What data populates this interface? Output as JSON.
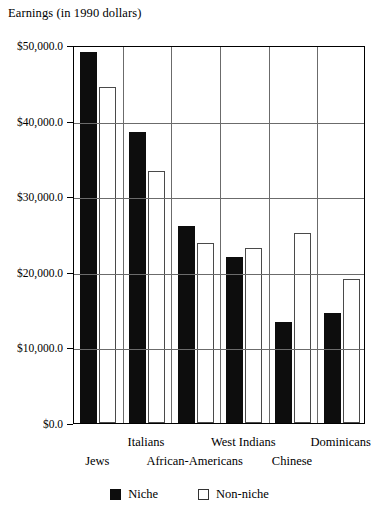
{
  "chart_data": {
    "type": "bar",
    "title": "Earnings (in 1990 dollars)",
    "xlabel": "",
    "ylabel": "",
    "ylim": [
      0,
      50000
    ],
    "grid": true,
    "legend_position": "bottom-center",
    "categories": [
      "Jews",
      "Italians",
      "African-Americans",
      "West Indians",
      "Chinese",
      "Dominicans"
    ],
    "ytick_labels": [
      "$0.0",
      "$10,000.0",
      "$20,000.0",
      "$30,000.0",
      "$40,000.0",
      "$50,000.0"
    ],
    "ytick_values": [
      0,
      10000,
      20000,
      30000,
      40000,
      50000
    ],
    "series": [
      {
        "name": "Niche",
        "color": "#0d0d0d",
        "values": [
          49100,
          38500,
          26000,
          21900,
          13400,
          14500
        ]
      },
      {
        "name": "Non-niche",
        "color": "#ffffff",
        "values": [
          44500,
          33300,
          23800,
          23200,
          25100,
          19100
        ]
      }
    ]
  },
  "axis": {
    "y_title": "Earnings (in 1990 dollars)"
  },
  "legend": {
    "items": [
      {
        "label": "Niche",
        "swatch": "filled-square-icon"
      },
      {
        "label": "Non-niche",
        "swatch": "hollow-square-icon"
      }
    ]
  },
  "x_label_rows": {
    "top": [
      "Italians",
      "West Indians",
      "Dominicans"
    ],
    "bottom": [
      "Jews",
      "African-Americans",
      "Chinese"
    ]
  }
}
